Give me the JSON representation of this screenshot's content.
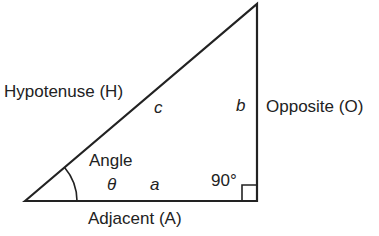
{
  "labels": {
    "hypotenuse": "Hypotenuse (H)",
    "opposite": "Opposite (O)",
    "adjacent": "Adjacent (A)",
    "angle": "Angle",
    "theta": "θ",
    "side_a": "a",
    "side_b": "b",
    "side_c": "c",
    "right_angle": "90°"
  },
  "colors": {
    "stroke": "#222222",
    "text": "#222222",
    "background": "#ffffff"
  }
}
